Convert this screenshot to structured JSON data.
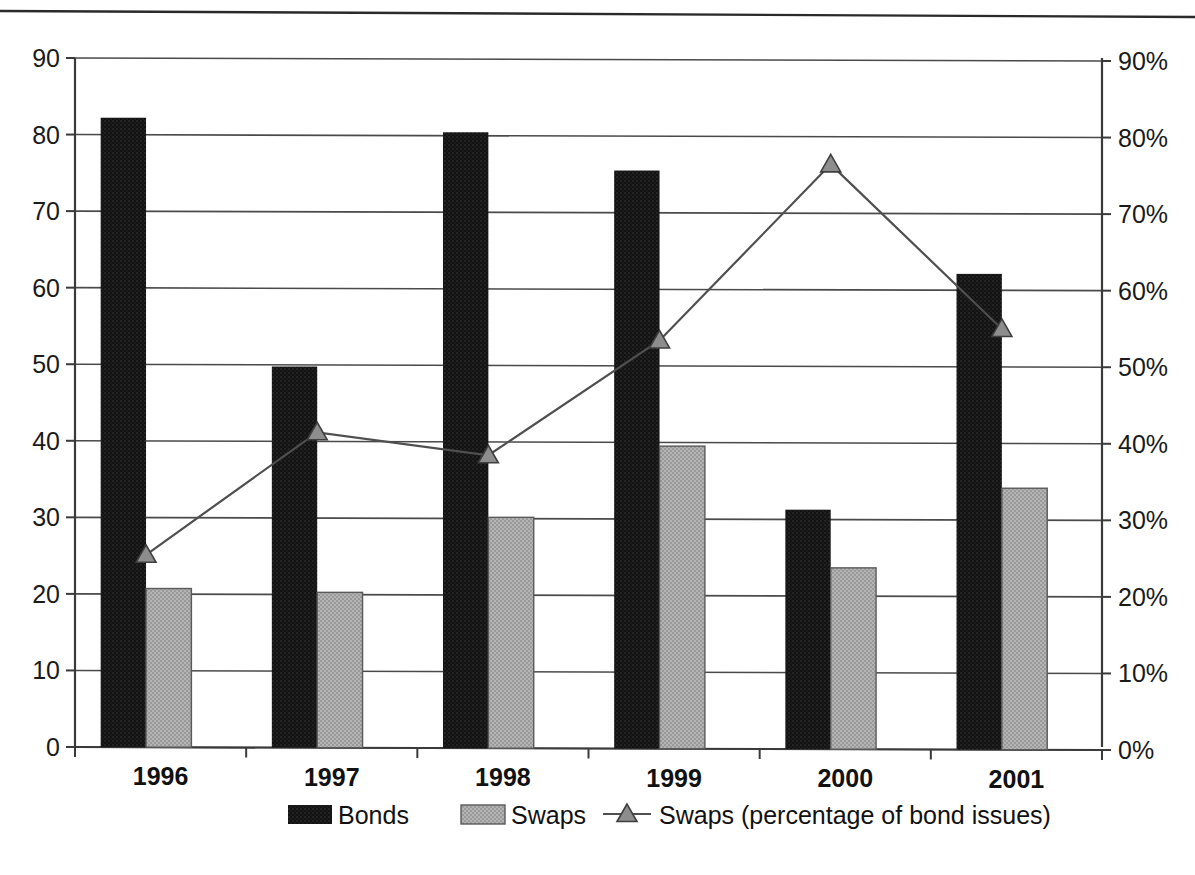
{
  "chart_data": {
    "type": "bar",
    "title": "",
    "subtitle": "",
    "xlabel": "",
    "ylabel": "",
    "categories": [
      "1996",
      "1997",
      "1998",
      "1999",
      "2000",
      "2001"
    ],
    "series": [
      {
        "name": "Bonds",
        "axis": "left",
        "type": "bar",
        "color": "#161616",
        "values": [
          82.2,
          49.7,
          80.3,
          75.3,
          31.0,
          61.8
        ]
      },
      {
        "name": "Swaps",
        "axis": "left",
        "type": "bar",
        "color": "#a6a6a6",
        "values": [
          20.7,
          20.2,
          30.0,
          39.3,
          23.4,
          33.8
        ]
      },
      {
        "name": "Swaps (percentage of bond issues)",
        "axis": "right",
        "type": "line",
        "marker": "triangle",
        "color": "#4f4f4f",
        "values": [
          25.5,
          41.5,
          38.5,
          53.5,
          76.5,
          55.0
        ]
      }
    ],
    "left_axis": {
      "ylim": [
        0,
        90
      ],
      "ticks": [
        0,
        10,
        20,
        30,
        40,
        50,
        60,
        70,
        80,
        90
      ],
      "tick_labels": [
        "0",
        "10",
        "20",
        "30",
        "40",
        "50",
        "60",
        "70",
        "80",
        "90"
      ]
    },
    "right_axis": {
      "ylim": [
        0,
        90
      ],
      "ticks": [
        0,
        10,
        20,
        30,
        40,
        50,
        60,
        70,
        80,
        90
      ],
      "tick_labels": [
        "0%",
        "10%",
        "20%",
        "30%",
        "40%",
        "50%",
        "60%",
        "70%",
        "80%",
        "90%"
      ]
    },
    "grid": true,
    "legend_position": "bottom",
    "legend": [
      {
        "label": "Bonds",
        "marker": "filled-rect",
        "color": "#161616"
      },
      {
        "label": "Swaps",
        "marker": "filled-rect",
        "color": "#a6a6a6"
      },
      {
        "label": "Swaps (percentage of bond issues)",
        "marker": "line-triangle",
        "color": "#4f4f4f"
      }
    ]
  }
}
